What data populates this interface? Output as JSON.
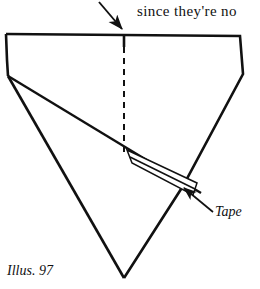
{
  "page": {
    "width": 260,
    "height": 289,
    "background": "#ffffff",
    "ink": "#111111"
  },
  "prose": {
    "line": "since they're no"
  },
  "caption": {
    "text": "Illus. 97"
  },
  "figure": {
    "title": "Illus. 97",
    "labels": [
      {
        "id": "tape-label",
        "text": "Tape",
        "x": 215,
        "y": 216,
        "anchor": "start"
      }
    ],
    "annotations": {
      "top_arrow": {
        "name": "fold-direction-arrow",
        "from_x": 99,
        "from_y": 2,
        "to_x": 124,
        "to_y": 31
      },
      "tape_pointer": {
        "name": "tape-leader-arrow",
        "from_x": 212,
        "from_y": 211,
        "to_x": 182,
        "to_y": 187
      }
    },
    "geometry": {
      "sheet_outline": "6,34 240,36 243,74 183,186 124,278 8,76 7,34",
      "dashed_centerline": {
        "x": 124,
        "y1": 36,
        "y2": 157
      },
      "fold_line": "8,76 200,192",
      "left_diagonal": "8,76 124,278",
      "tape_strip": "127,151 131,162 191,194 196,184",
      "tape_inner_line": "131,158 193,190",
      "tape_end_cap": "127,151 131,162"
    },
    "colors": {
      "stroke": "#111111",
      "fill": "#ffffff"
    },
    "stroke_widths": {
      "outline": 2.6,
      "fold": 2.4,
      "tape": 1.4,
      "dashed": 2.0,
      "arrow": 1.8
    }
  }
}
